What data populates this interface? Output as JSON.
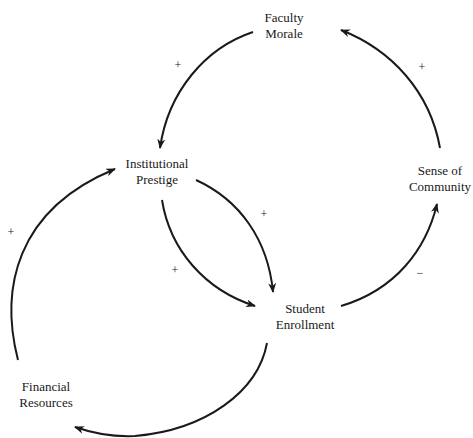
{
  "diagram": {
    "type": "causal-loop",
    "nodes": [
      {
        "id": "faculty_morale",
        "lines": [
          "Faculty",
          "Morale"
        ]
      },
      {
        "id": "institutional_prestige",
        "lines": [
          "Institutional",
          "Prestige"
        ]
      },
      {
        "id": "sense_of_community",
        "lines": [
          "Sense of",
          "Community"
        ]
      },
      {
        "id": "student_enrollment",
        "lines": [
          "Student",
          "Enrollment"
        ]
      },
      {
        "id": "financial_resources",
        "lines": [
          "Financial",
          "Resources"
        ]
      }
    ],
    "edges": [
      {
        "from": "faculty_morale",
        "to": "institutional_prestige",
        "sign": "+"
      },
      {
        "from": "sense_of_community",
        "to": "faculty_morale",
        "sign": "+"
      },
      {
        "from": "institutional_prestige",
        "to": "student_enrollment",
        "sign": "+",
        "label": "upper"
      },
      {
        "from": "institutional_prestige",
        "to": "student_enrollment",
        "sign": "+",
        "label": "lower"
      },
      {
        "from": "student_enrollment",
        "to": "sense_of_community",
        "sign": "−"
      },
      {
        "from": "student_enrollment",
        "to": "financial_resources",
        "sign": ""
      },
      {
        "from": "financial_resources",
        "to": "institutional_prestige",
        "sign": "+"
      }
    ],
    "colors": {
      "line": "#1a1a1a",
      "background": "#ffffff"
    }
  }
}
